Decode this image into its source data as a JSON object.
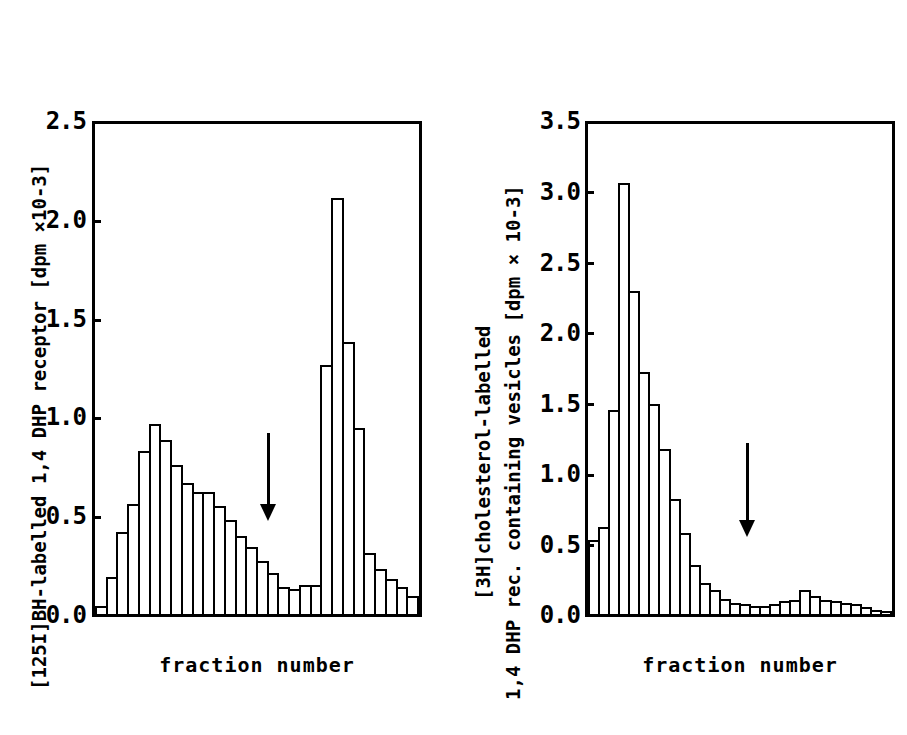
{
  "figure": {
    "background": "#ffffff",
    "ink": "#000000",
    "panel_count": 2
  },
  "panels": [
    {
      "id": "left",
      "ylabel_prefix": "[",
      "ylabel_sup": "125",
      "ylabel_text": "I]BH-labelled 1,4 DHP receptor [dpm ×10-3]",
      "ylabel_full": "[125I]BH-labelled 1,4 DHP receptor [dpm ×10-3]",
      "xlabel": "fraction number",
      "ticks": [
        "0.0",
        "0.5",
        "1.0",
        "1.5",
        "2.0",
        "2.5"
      ],
      "arrow_name": "peak-marker-arrow"
    },
    {
      "id": "right",
      "ylabel_prefix": "[",
      "ylabel_sup": "3",
      "ylabel_text": "H]cholesterol-labelled",
      "ylabel_line2": "1,4 DHP rec. containing vesicles [dpm × 10-3]",
      "ylabel_full": "[3H]cholesterol-labelled 1,4 DHP rec. containing vesicles [dpm × 10-3]",
      "xlabel": "fraction number",
      "ticks": [
        "0.0",
        "0.5",
        "1.0",
        "1.5",
        "2.0",
        "2.5",
        "3.0",
        "3.5"
      ],
      "arrow_name": "peak-marker-arrow"
    }
  ],
  "chart_data": [
    {
      "type": "bar",
      "id": "left-panel-histogram",
      "title": "",
      "xlabel": "fraction number",
      "ylabel": "[125I]BH-labelled 1,4 DHP receptor [dpm ×10-3]",
      "ylim": [
        0,
        2.5
      ],
      "yticks": [
        0.0,
        0.5,
        1.0,
        1.5,
        2.0,
        2.5
      ],
      "ytick_labels": [
        "0.0",
        "0.5",
        "1.0",
        "1.5",
        "2.0",
        "2.5"
      ],
      "grid": false,
      "legend": null,
      "x_axis_ticks_shown": false,
      "categories": [
        1,
        2,
        3,
        4,
        5,
        6,
        7,
        8,
        9,
        10,
        11,
        12,
        13,
        14,
        15,
        16,
        17,
        18,
        19,
        20,
        21,
        22,
        23,
        24,
        25,
        26,
        27,
        28,
        29,
        30
      ],
      "values": [
        0.04,
        0.19,
        0.42,
        0.56,
        0.83,
        0.97,
        0.89,
        0.76,
        0.67,
        0.62,
        0.62,
        0.55,
        0.48,
        0.4,
        0.34,
        0.27,
        0.21,
        0.14,
        0.13,
        0.15,
        0.15,
        1.27,
        2.12,
        1.39,
        0.95,
        0.31,
        0.23,
        0.18,
        0.14,
        0.09
      ],
      "annotations": [
        {
          "type": "arrow",
          "direction": "down",
          "at_category": 18,
          "label": ""
        }
      ]
    },
    {
      "type": "bar",
      "id": "right-panel-histogram",
      "title": "",
      "xlabel": "fraction number",
      "ylabel": "[3H]cholesterol-labelled 1,4 DHP rec. containing vesicles [dpm × 10-3]",
      "ylim": [
        0,
        3.5
      ],
      "yticks": [
        0.0,
        0.5,
        1.0,
        1.5,
        2.0,
        2.5,
        3.0,
        3.5
      ],
      "ytick_labels": [
        "0.0",
        "0.5",
        "1.0",
        "1.5",
        "2.0",
        "2.5",
        "3.0",
        "3.5"
      ],
      "grid": false,
      "legend": null,
      "x_axis_ticks_shown": false,
      "categories": [
        1,
        2,
        3,
        4,
        5,
        6,
        7,
        8,
        9,
        10,
        11,
        12,
        13,
        14,
        15,
        16,
        17,
        18,
        19,
        20,
        21,
        22,
        23,
        24,
        25,
        26,
        27,
        28,
        29,
        30
      ],
      "values": [
        0.53,
        0.62,
        1.46,
        3.08,
        2.31,
        1.73,
        1.5,
        1.18,
        0.82,
        0.58,
        0.35,
        0.22,
        0.17,
        0.11,
        0.08,
        0.07,
        0.06,
        0.06,
        0.07,
        0.09,
        0.1,
        0.17,
        0.13,
        0.1,
        0.09,
        0.08,
        0.07,
        0.05,
        0.03,
        0.02
      ],
      "annotations": [
        {
          "type": "arrow",
          "direction": "down",
          "at_category": 18,
          "label": ""
        }
      ]
    }
  ]
}
